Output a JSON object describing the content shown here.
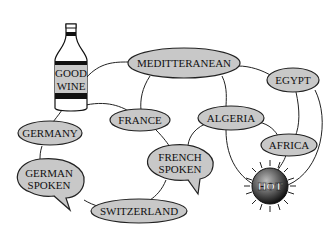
{
  "diagram": {
    "type": "semantic-network",
    "nodes": {
      "good_wine": {
        "line1": "GOOD",
        "line2": "WINE",
        "shape": "bottle"
      },
      "mediterranean": {
        "label": "MEDITTERANEAN",
        "shape": "ellipse"
      },
      "egypt": {
        "label": "EGYPT",
        "shape": "ellipse"
      },
      "germany": {
        "label": "GERMANY",
        "shape": "ellipse"
      },
      "france": {
        "label": "FRANCE",
        "shape": "ellipse"
      },
      "algeria": {
        "label": "ALGERIA",
        "shape": "ellipse"
      },
      "africa": {
        "label": "AFRICA",
        "shape": "ellipse"
      },
      "german_spoken": {
        "line1": "GERMAN",
        "line2": "SPOKEN",
        "shape": "speech-bubble"
      },
      "french_spoken": {
        "line1": "FRENCH",
        "line2": "SPOKEN",
        "shape": "speech-bubble"
      },
      "switzerland": {
        "label": "SWITZERLAND",
        "shape": "ellipse"
      },
      "hot": {
        "label": "HOT",
        "shape": "sun"
      }
    },
    "edges": [
      [
        "good_wine",
        "mediterranean"
      ],
      [
        "good_wine",
        "france"
      ],
      [
        "good_wine",
        "germany"
      ],
      [
        "mediterranean",
        "france"
      ],
      [
        "mediterranean",
        "algeria"
      ],
      [
        "mediterranean",
        "egypt"
      ],
      [
        "egypt",
        "africa"
      ],
      [
        "egypt",
        "hot"
      ],
      [
        "algeria",
        "africa"
      ],
      [
        "algeria",
        "hot"
      ],
      [
        "algeria",
        "french_spoken"
      ],
      [
        "africa",
        "hot"
      ],
      [
        "france",
        "french_spoken"
      ],
      [
        "germany",
        "german_spoken"
      ],
      [
        "german_spoken",
        "switzerland"
      ],
      [
        "french_spoken",
        "switzerland"
      ]
    ]
  }
}
